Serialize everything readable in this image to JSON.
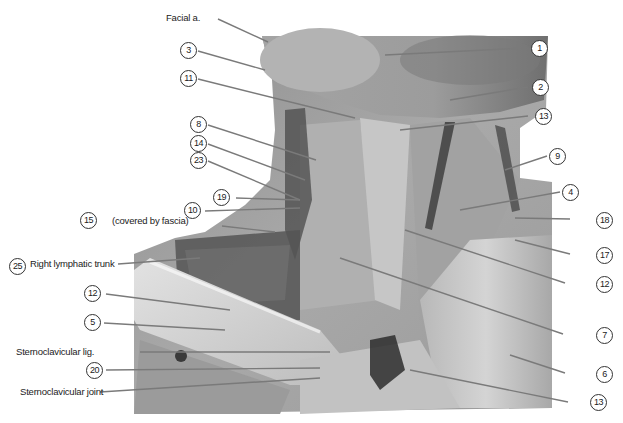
{
  "figure": {
    "type": "anatomical-dissection-photo",
    "region": "anterior neck / root of neck",
    "colors": {
      "background": "#ffffff",
      "leader_line": "#7a7a7a",
      "label_text": "#222222"
    }
  },
  "labels_text": {
    "facial_a": "Facial a.",
    "covered_by_fascia": "(covered by fascia)",
    "right_lymphatic_trunk": "Right lymphatic trunk",
    "sternoclavicular_lig": "Sternoclavicular lig.",
    "sternoclavicular_joint": "Sternoclavicular joint"
  },
  "callouts_left": [
    {
      "id": "3",
      "num": "3"
    },
    {
      "id": "11",
      "num": "11"
    },
    {
      "id": "8",
      "num": "8"
    },
    {
      "id": "14",
      "num": "14"
    },
    {
      "id": "23",
      "num": "23"
    },
    {
      "id": "19",
      "num": "19"
    },
    {
      "id": "10",
      "num": "10"
    },
    {
      "id": "15",
      "num": "15"
    },
    {
      "id": "25",
      "num": "25"
    },
    {
      "id": "12a",
      "num": "12"
    },
    {
      "id": "5",
      "num": "5"
    },
    {
      "id": "20",
      "num": "20"
    }
  ],
  "callouts_right": [
    {
      "id": "1",
      "num": "1"
    },
    {
      "id": "2",
      "num": "2"
    },
    {
      "id": "13a",
      "num": "13"
    },
    {
      "id": "9",
      "num": "9"
    },
    {
      "id": "4",
      "num": "4"
    },
    {
      "id": "18",
      "num": "18"
    },
    {
      "id": "17",
      "num": "17"
    },
    {
      "id": "12b",
      "num": "12"
    },
    {
      "id": "7",
      "num": "7"
    },
    {
      "id": "6",
      "num": "6"
    },
    {
      "id": "13b",
      "num": "13"
    }
  ]
}
